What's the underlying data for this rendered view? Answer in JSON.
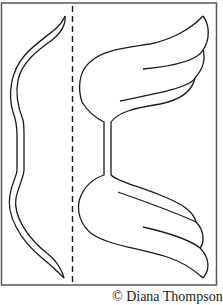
{
  "figure": {
    "caption": "© Diana Thompson",
    "colors": {
      "line": "#1a1a1a",
      "frame": "#555555",
      "background": "#ffffff"
    },
    "parts": [
      {
        "name": "left-strip",
        "description": "narrow curved strip piece"
      },
      {
        "name": "fold-line",
        "description": "dashed fold line"
      },
      {
        "name": "wing-piece",
        "description": "double wing shape with stem"
      }
    ]
  }
}
